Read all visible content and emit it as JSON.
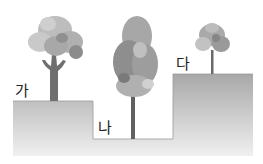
{
  "labels": {
    "a": "가",
    "b": "나",
    "c": "다"
  },
  "colors": {
    "ground_top": "#a9a9a9",
    "ground_bottom": "#eeeeee",
    "trunk": "#6e6e6e",
    "foliage_light": "#c9c9c9",
    "foliage_mid": "#a5a5a5",
    "foliage_dark": "#858585"
  }
}
